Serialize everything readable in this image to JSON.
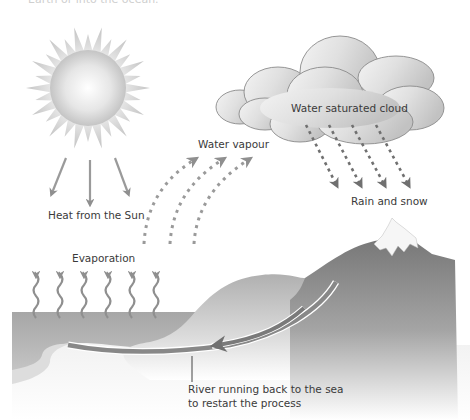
{
  "title_fragment": "Earth or into the ocean.",
  "labels": {
    "sun": "Heat from the Sun",
    "vapour": "Water vapour",
    "cloud": "Water saturated cloud",
    "rain": "Rain and snow",
    "evaporation": "Evaporation",
    "river_line1": "River running back to the sea",
    "river_line2": "to restart the process"
  },
  "colors": {
    "arrow": "#8f8f8f",
    "cloud_stroke": "#8a8a8a",
    "cloud_fill": "#d4d4d4",
    "sea": "#a8a8a8",
    "mountain": "#7d7d7d",
    "text": "#3a3a3a"
  },
  "diagram": {
    "sun_arrows": 3,
    "vapour_arrows": 3,
    "rain_arrows": 4,
    "evaporation_arrows": 6
  }
}
